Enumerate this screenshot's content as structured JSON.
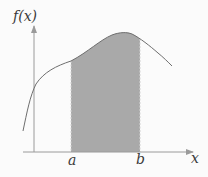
{
  "diagram": {
    "type": "definite-integral-area",
    "labels": {
      "y_axis": "f(x)",
      "x_axis": "x",
      "lower_bound": "a",
      "upper_bound": "b"
    },
    "colors": {
      "background": "#fbfbfb",
      "axis": "#9a9a9a",
      "curve": "#6e6e6e",
      "shaded_area": "#a9a9a9",
      "bound_lines": "#cfcfcf",
      "label_text": "#3a3a3a"
    }
  }
}
